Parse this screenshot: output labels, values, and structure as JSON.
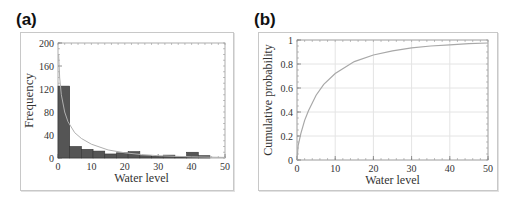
{
  "panels": [
    {
      "label": "(a)"
    },
    {
      "label": "(b)"
    }
  ],
  "chart_data": [
    {
      "type": "bar",
      "title": "(a)",
      "xlabel": "Water level",
      "ylabel": "Frequency",
      "xlim": [
        0,
        50
      ],
      "ylim": [
        0,
        200
      ],
      "x_ticks": [
        0,
        10,
        20,
        30,
        40,
        50
      ],
      "y_ticks": [
        0,
        40,
        80,
        120,
        160,
        200
      ],
      "bin_width": 3.5,
      "bin_starts": [
        0,
        3.5,
        7,
        10.5,
        14,
        17.5,
        21,
        24.5,
        28,
        31.5,
        35,
        38.5,
        42
      ],
      "values": [
        125,
        20,
        15,
        12,
        7,
        9,
        11,
        4,
        3,
        5,
        2,
        10,
        4
      ],
      "overlay_curve": {
        "name": "fitted density",
        "x": [
          0.2,
          0.5,
          1,
          2,
          3,
          5,
          7,
          10,
          15,
          20,
          25,
          30,
          40,
          50
        ],
        "y": [
          180,
          140,
          110,
          80,
          63,
          44,
          34,
          24,
          14,
          9,
          6,
          4,
          2,
          1
        ]
      },
      "grid": false,
      "bar_color": "#555555",
      "curve_color": "#b0b0b0"
    },
    {
      "type": "line",
      "title": "(b)",
      "xlabel": "Water level",
      "ylabel": "Cumulative probability",
      "xlim": [
        0,
        50
      ],
      "ylim": [
        0,
        1
      ],
      "x_ticks": [
        0,
        10,
        20,
        30,
        40,
        50
      ],
      "y_ticks": [
        0,
        0.2,
        0.4,
        0.6,
        0.8,
        1
      ],
      "series": [
        {
          "name": "CDF",
          "x": [
            0,
            0.3,
            1,
            2,
            3,
            5,
            7,
            10,
            15,
            20,
            25,
            30,
            35,
            40,
            45,
            50
          ],
          "y": [
            0,
            0.12,
            0.22,
            0.33,
            0.41,
            0.54,
            0.63,
            0.72,
            0.82,
            0.875,
            0.91,
            0.935,
            0.95,
            0.96,
            0.97,
            0.975
          ]
        }
      ],
      "grid": true,
      "line_color": "#a8a8a8"
    }
  ]
}
